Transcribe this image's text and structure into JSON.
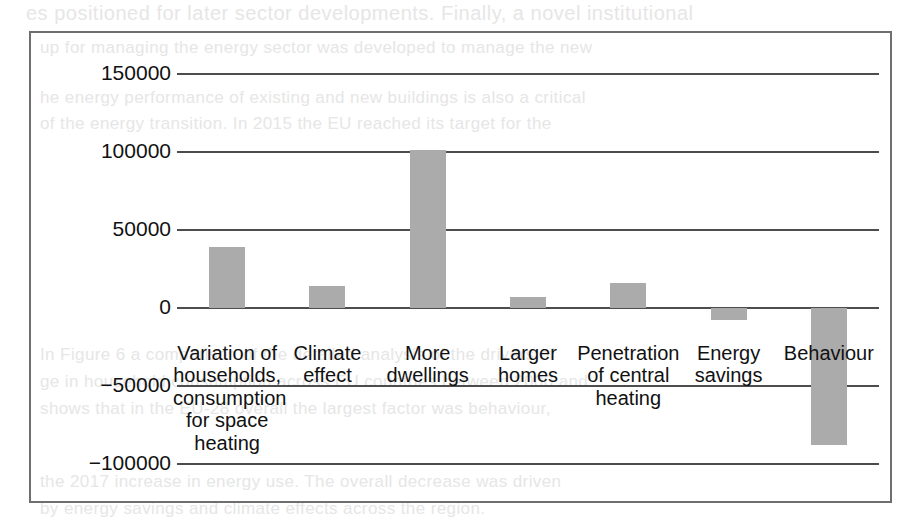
{
  "figure": {
    "frame_color": "#6f6f6f",
    "bar_color": "#ababab",
    "gridline_color": "#4d4d4d"
  },
  "chart_data": {
    "type": "bar",
    "title": "",
    "subtitle": "",
    "xlabel": "",
    "ylabel": "",
    "grid": true,
    "legend": "none",
    "ylim": [
      -100000,
      150000
    ],
    "yticks": [
      150000,
      100000,
      50000,
      0,
      -50000,
      -100000
    ],
    "ytick_labels": [
      "150000",
      "100000",
      "50000",
      "0",
      "−50000",
      "−100000"
    ],
    "categories": [
      "Variation of\nhouseholds,\nconsumption\nfor space\nheating",
      "Climate\neffect",
      "More\ndwellings",
      "Larger\nhomes",
      "Penetration\nof central\nheating",
      "Energy\nsavings",
      "Behaviour"
    ],
    "values": [
      39000,
      14000,
      101000,
      7000,
      16000,
      -8000,
      -88000
    ]
  },
  "bleed_text": {
    "l1": "es positioned for later sector developments. Finally, a novel institutional",
    "l2": "up for managing the energy sector was developed to manage the new",
    "l3": "wable energy plans.",
    "l4": "he energy performance of existing and new buildings is also a critical",
    "l5": "of the energy transition. In 2015 the EU reached its target for the",
    "l6": "n of renewable energy use in the residential sector.",
    "l7": "In Figure 6 a comparison of the detailed analysis of the drivers of",
    "l8": "ge in household consumption across EU countries between 2000 and",
    "l9": "shows that in the EU-28 overall the largest factor was behaviour,",
    "l10": "the 2017 increase in energy use. The overall decrease was driven",
    "l11": "by energy savings and climate effects across the region."
  }
}
